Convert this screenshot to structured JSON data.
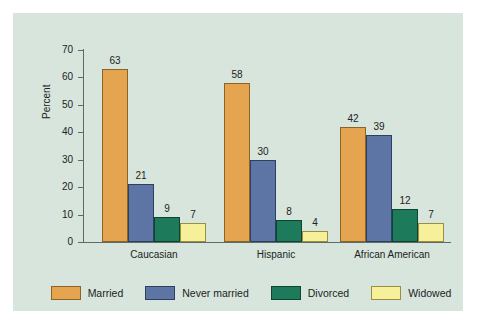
{
  "chart_data": {
    "type": "bar",
    "title": "",
    "xlabel": "",
    "ylabel": "Percent",
    "ylim": [
      0,
      70
    ],
    "yticks": [
      0,
      10,
      20,
      30,
      40,
      50,
      60,
      70
    ],
    "grid": false,
    "legend_position": "bottom",
    "categories": [
      "Caucasian",
      "Hispanic",
      "African American"
    ],
    "series": [
      {
        "name": "Married",
        "color": "#e5a44f",
        "values": [
          63,
          58,
          42
        ]
      },
      {
        "name": "Never married",
        "color": "#5c75a5",
        "values": [
          21,
          30,
          39
        ]
      },
      {
        "name": "Divorced",
        "color": "#1d7a5a",
        "values": [
          9,
          8,
          12
        ]
      },
      {
        "name": "Widowed",
        "color": "#f7f09a",
        "values": [
          7,
          4,
          7
        ]
      }
    ]
  },
  "colors": {
    "panel_background": "#d7e5dd",
    "figure_background": "#ffffff",
    "axis": "#5d6b66",
    "text": "#1c2320",
    "married": "#e5a44f",
    "never_married": "#5c75a5",
    "divorced": "#1d7a5a",
    "widowed": "#f7f09a"
  }
}
